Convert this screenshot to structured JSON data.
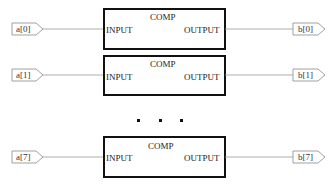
{
  "diagram": {
    "blocks": [
      {
        "title": "COMP",
        "input_port": "INPUT",
        "output_port": "OUTPUT",
        "input_pin": "a[0]",
        "output_pin": "b[0]"
      },
      {
        "title": "COMP",
        "input_port": "INPUT",
        "output_port": "OUTPUT",
        "input_pin": "a[1]",
        "output_pin": "b[1]"
      },
      {
        "title": "COMP",
        "input_port": "INPUT",
        "output_port": "OUTPUT",
        "input_pin": "a[7]",
        "output_pin": "b[7]"
      }
    ],
    "ellipsis": "▪ ▪ ▪"
  }
}
